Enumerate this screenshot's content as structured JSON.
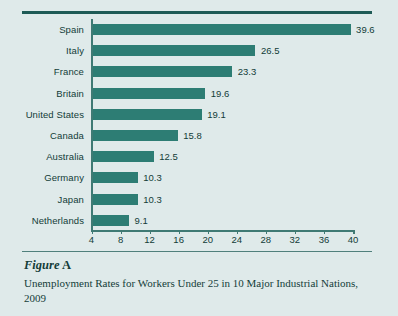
{
  "figure": {
    "label_word": "Figure",
    "label_letter": "A",
    "caption": "Unemployment Rates for Workers Under 25 in 10 Major Industrial Nations, 2009"
  },
  "colors": {
    "bar": "#2d7d74",
    "background": "#dfeaea",
    "rule": "#1e5b56",
    "text": "#123c38"
  },
  "chart_data": {
    "type": "bar",
    "orientation": "horizontal",
    "title": "",
    "subtitle": "",
    "xlabel": "",
    "ylabel": "",
    "xlim": [
      4,
      40
    ],
    "xticks": [
      4,
      8,
      12,
      16,
      20,
      24,
      28,
      32,
      36,
      40
    ],
    "xtick_labels": [
      "4",
      "8",
      "12",
      "16",
      "20",
      "24",
      "28",
      "32",
      "36",
      "40"
    ],
    "grid": false,
    "legend": false,
    "data_labels": true,
    "categories": [
      "Spain",
      "Italy",
      "France",
      "Britain",
      "United States",
      "Canada",
      "Australia",
      "Germany",
      "Japan",
      "Netherlands"
    ],
    "values": [
      39.6,
      26.5,
      23.3,
      19.6,
      19.1,
      15.8,
      12.5,
      10.3,
      10.3,
      9.1
    ],
    "value_labels": [
      "39.6",
      "26.5",
      "23.3",
      "19.6",
      "19.1",
      "15.8",
      "12.5",
      "10.3",
      "10.3",
      "9.1"
    ]
  }
}
